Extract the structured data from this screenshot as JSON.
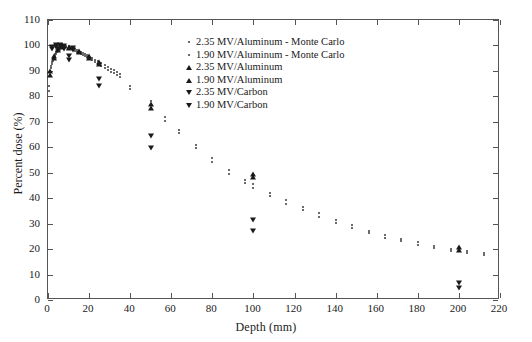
{
  "chart_data": {
    "type": "scatter",
    "title": "",
    "xlabel": "Depth (mm)",
    "ylabel": "Percent dose (%)",
    "xlim": [
      0,
      220
    ],
    "ylim": [
      0,
      110
    ],
    "xticks": [
      0,
      20,
      40,
      60,
      80,
      100,
      120,
      140,
      160,
      180,
      200,
      220
    ],
    "yticks": [
      0,
      10,
      20,
      30,
      40,
      50,
      60,
      70,
      80,
      90,
      100,
      110
    ],
    "grid": false,
    "legend_position": "upper-center-right",
    "series": [
      {
        "name": "2.35 MV/Aluminum - Monte Carlo",
        "marker": "dot",
        "points": [
          [
            0.5,
            84.2
          ],
          [
            1.0,
            89.5
          ],
          [
            1.5,
            92.0
          ],
          [
            2.0,
            93.4
          ],
          [
            2.5,
            94.6
          ],
          [
            3.0,
            95.6
          ],
          [
            3.5,
            96.6
          ],
          [
            4.0,
            97.4
          ],
          [
            4.5,
            98.1
          ],
          [
            5.0,
            98.7
          ],
          [
            5.5,
            99.2
          ],
          [
            6.0,
            99.6
          ],
          [
            6.5,
            99.9
          ],
          [
            7.0,
            100.0
          ],
          [
            8.0,
            100.0
          ],
          [
            9.0,
            99.8
          ],
          [
            10.0,
            99.6
          ],
          [
            11.0,
            99.3
          ],
          [
            12.0,
            99.0
          ],
          [
            13.0,
            98.7
          ],
          [
            14.0,
            98.3
          ],
          [
            15.0,
            97.9
          ],
          [
            16.0,
            97.5
          ],
          [
            17.0,
            97.1
          ],
          [
            18.0,
            96.7
          ],
          [
            19.0,
            96.2
          ],
          [
            20.0,
            95.8
          ],
          [
            21.5,
            95.1
          ],
          [
            23.0,
            94.4
          ],
          [
            24.5,
            93.7
          ],
          [
            26.0,
            93.0
          ],
          [
            27.5,
            92.3
          ],
          [
            29.0,
            91.6
          ],
          [
            30.5,
            90.9
          ],
          [
            32.0,
            90.2
          ],
          [
            33.5,
            89.5
          ],
          [
            35.0,
            88.8
          ],
          [
            40.0,
            84.0
          ],
          [
            50.0,
            78.3
          ],
          [
            57.0,
            72.0
          ],
          [
            64.0,
            66.9
          ],
          [
            72.0,
            61.0
          ],
          [
            80.0,
            55.7
          ],
          [
            88.0,
            51.0
          ],
          [
            96.0,
            47.3
          ],
          [
            100.0,
            45.6
          ],
          [
            108.0,
            42.2
          ],
          [
            116.0,
            39.3
          ],
          [
            124.0,
            36.6
          ],
          [
            132.0,
            34.1
          ],
          [
            140.0,
            31.6
          ],
          [
            148.0,
            29.4
          ],
          [
            156.0,
            27.3
          ],
          [
            164.0,
            25.6
          ],
          [
            172.0,
            24.0
          ],
          [
            180.0,
            22.6
          ],
          [
            188.0,
            21.3
          ],
          [
            196.0,
            20.2
          ],
          [
            204.0,
            19.3
          ],
          [
            212.0,
            18.4
          ]
        ]
      },
      {
        "name": "1.90 MV/Aluminum - Monte Carlo",
        "marker": "dot",
        "points": [
          [
            0.5,
            82.0
          ],
          [
            1.0,
            88.3
          ],
          [
            1.5,
            91.0
          ],
          [
            2.0,
            92.6
          ],
          [
            2.5,
            93.9
          ],
          [
            3.0,
            95.0
          ],
          [
            3.5,
            96.0
          ],
          [
            4.0,
            96.8
          ],
          [
            4.5,
            97.6
          ],
          [
            5.0,
            98.2
          ],
          [
            5.5,
            98.8
          ],
          [
            6.0,
            99.2
          ],
          [
            6.5,
            99.5
          ],
          [
            7.0,
            99.7
          ],
          [
            8.0,
            99.6
          ],
          [
            9.0,
            99.4
          ],
          [
            10.0,
            99.1
          ],
          [
            11.0,
            98.8
          ],
          [
            12.0,
            98.4
          ],
          [
            13.0,
            98.0
          ],
          [
            14.0,
            97.6
          ],
          [
            15.0,
            97.2
          ],
          [
            16.0,
            96.8
          ],
          [
            17.0,
            96.3
          ],
          [
            18.0,
            95.9
          ],
          [
            19.0,
            95.4
          ],
          [
            20.0,
            95.0
          ],
          [
            21.5,
            94.2
          ],
          [
            23.0,
            93.5
          ],
          [
            24.5,
            92.7
          ],
          [
            26.0,
            92.0
          ],
          [
            27.5,
            91.2
          ],
          [
            29.0,
            90.5
          ],
          [
            30.5,
            89.7
          ],
          [
            32.0,
            89.0
          ],
          [
            33.5,
            88.3
          ],
          [
            35.0,
            87.5
          ],
          [
            40.0,
            82.8
          ],
          [
            50.0,
            76.5
          ],
          [
            57.0,
            70.2
          ],
          [
            64.0,
            65.6
          ],
          [
            72.0,
            59.6
          ],
          [
            80.0,
            54.2
          ],
          [
            88.0,
            49.6
          ],
          [
            96.0,
            45.8
          ],
          [
            100.0,
            44.0
          ],
          [
            108.0,
            40.7
          ],
          [
            116.0,
            37.9
          ],
          [
            124.0,
            35.2
          ],
          [
            132.0,
            32.8
          ],
          [
            140.0,
            30.4
          ],
          [
            148.0,
            28.2
          ],
          [
            156.0,
            26.2
          ],
          [
            164.0,
            24.5
          ],
          [
            172.0,
            23.0
          ],
          [
            180.0,
            21.6
          ],
          [
            188.0,
            20.4
          ],
          [
            196.0,
            19.4
          ],
          [
            204.0,
            18.5
          ],
          [
            212.0,
            17.7
          ]
        ]
      },
      {
        "name": "2.35 MV/Aluminum",
        "marker": "up-triangle",
        "points": [
          [
            1.0,
            90.0
          ],
          [
            3.0,
            96.0
          ],
          [
            5.0,
            99.0
          ],
          [
            7.0,
            100.0
          ],
          [
            10.0,
            99.5
          ],
          [
            15.0,
            98.0
          ],
          [
            20.0,
            96.0
          ],
          [
            25.0,
            93.5
          ],
          [
            50.0,
            77.0
          ],
          [
            100.0,
            49.5
          ],
          [
            200.0,
            20.8
          ]
        ]
      },
      {
        "name": "1.90 MV/Aluminum",
        "marker": "up-triangle",
        "points": [
          [
            1.0,
            88.5
          ],
          [
            3.0,
            95.0
          ],
          [
            5.0,
            98.3
          ],
          [
            7.0,
            99.5
          ],
          [
            10.0,
            99.0
          ],
          [
            15.0,
            97.4
          ],
          [
            20.0,
            95.2
          ],
          [
            25.0,
            92.8
          ],
          [
            50.0,
            75.5
          ],
          [
            100.0,
            48.3
          ],
          [
            200.0,
            19.5
          ]
        ]
      },
      {
        "name": "2.35 MV/Carbon",
        "marker": "down-triangle",
        "points": [
          [
            2.0,
            99.3
          ],
          [
            4.0,
            100.0
          ],
          [
            6.0,
            100.0
          ],
          [
            8.0,
            99.8
          ],
          [
            10.0,
            96.0
          ],
          [
            12.0,
            99.0
          ],
          [
            25.0,
            87.0
          ],
          [
            50.0,
            64.5
          ],
          [
            100.0,
            31.5
          ],
          [
            200.0,
            6.5
          ]
        ]
      },
      {
        "name": "1.90 MV/Carbon",
        "marker": "down-triangle",
        "points": [
          [
            2.0,
            98.5
          ],
          [
            4.0,
            99.5
          ],
          [
            6.0,
            99.6
          ],
          [
            8.0,
            98.8
          ],
          [
            10.0,
            94.2
          ],
          [
            12.0,
            98.2
          ],
          [
            25.0,
            84.0
          ],
          [
            50.0,
            59.8
          ],
          [
            100.0,
            27.0
          ],
          [
            200.0,
            4.8
          ]
        ]
      }
    ]
  }
}
